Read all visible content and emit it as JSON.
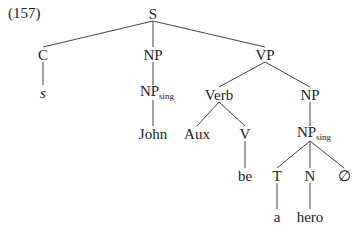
{
  "example_number": "(157)",
  "tree": {
    "nodes": [
      {
        "id": "S",
        "label": "S",
        "sub": ""
      },
      {
        "id": "C",
        "label": "C",
        "sub": ""
      },
      {
        "id": "s",
        "label": "s",
        "sub": "",
        "italic": true
      },
      {
        "id": "NP1",
        "label": "NP",
        "sub": ""
      },
      {
        "id": "NPsing1",
        "label": "NP",
        "sub": "sing"
      },
      {
        "id": "John",
        "label": "John",
        "sub": ""
      },
      {
        "id": "VP",
        "label": "VP",
        "sub": ""
      },
      {
        "id": "Verb",
        "label": "Verb",
        "sub": ""
      },
      {
        "id": "Aux",
        "label": "Aux",
        "sub": ""
      },
      {
        "id": "V",
        "label": "V",
        "sub": ""
      },
      {
        "id": "be",
        "label": "be",
        "sub": ""
      },
      {
        "id": "NP2",
        "label": "NP",
        "sub": ""
      },
      {
        "id": "NPsing2",
        "label": "NP",
        "sub": "sing"
      },
      {
        "id": "T",
        "label": "T",
        "sub": ""
      },
      {
        "id": "N",
        "label": "N",
        "sub": ""
      },
      {
        "id": "null",
        "label": "∅",
        "sub": ""
      },
      {
        "id": "a",
        "label": "a",
        "sub": ""
      },
      {
        "id": "hero",
        "label": "hero",
        "sub": ""
      }
    ],
    "edges": [
      [
        "S",
        "C"
      ],
      [
        "S",
        "NP1"
      ],
      [
        "S",
        "VP"
      ],
      [
        "C",
        "s"
      ],
      [
        "NP1",
        "NPsing1"
      ],
      [
        "NPsing1",
        "John"
      ],
      [
        "VP",
        "Verb"
      ],
      [
        "VP",
        "NP2"
      ],
      [
        "Verb",
        "Aux"
      ],
      [
        "Verb",
        "V"
      ],
      [
        "V",
        "be"
      ],
      [
        "NP2",
        "NPsing2"
      ],
      [
        "NPsing2",
        "T"
      ],
      [
        "NPsing2",
        "N"
      ],
      [
        "NPsing2",
        "null"
      ],
      [
        "T",
        "a"
      ],
      [
        "N",
        "hero"
      ]
    ]
  }
}
